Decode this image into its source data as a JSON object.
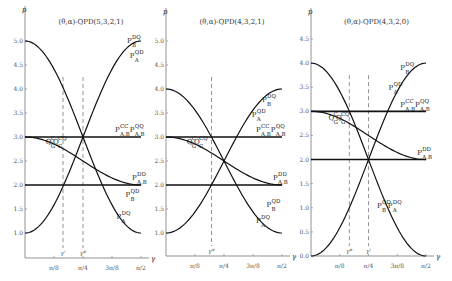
{
  "chart_data": [
    {
      "type": "line",
      "title": "(θ,α)-QPD(5,3,2,1)",
      "xlabel": "γ",
      "ylabel": "p",
      "xticks": [
        "π/8",
        "π/4",
        "3π/8",
        "π/2"
      ],
      "yticks": [
        "1.0",
        "1.5",
        "2.0",
        "2.5",
        "3.0",
        "3.5",
        "4.0",
        "4.5",
        "5.0"
      ],
      "xlim": [
        0,
        1.5708
      ],
      "ylim": [
        1.0,
        5.0
      ],
      "grid": false,
      "markers": [
        {
          "label": "γ'",
          "x": 0.5148,
          "style": "dashed"
        },
        {
          "label": "γ*",
          "x": 0.7854,
          "style": "dashed"
        }
      ],
      "series": [
        {
          "name": "P^DQ_B / P^QD_A (rising)",
          "formula": "3 - 2cos(2γ)",
          "x": [
            0,
            0.3927,
            0.7854,
            1.1781,
            1.5708
          ],
          "values": [
            1.0,
            1.59,
            3.0,
            4.41,
            5.0
          ]
        },
        {
          "name": "P^DQ_A / P^QD_B (falling)",
          "formula": "3 + 2cos(2γ)",
          "x": [
            0,
            0.3927,
            0.7854,
            1.1781,
            1.5708
          ],
          "values": [
            5.0,
            4.41,
            3.0,
            1.59,
            1.0
          ]
        },
        {
          "name": "P^CC_A,B  P^QQ_A,B",
          "x": [
            0,
            1.5708
          ],
          "values": [
            3.0,
            3.0
          ]
        },
        {
          "name": "P^DD_A,B",
          "x": [
            0,
            1.5708
          ],
          "values": [
            2.0,
            2.0
          ]
        },
        {
          "name": "Q_G curves",
          "formula": "2.5 + 0.5cos(2γ)",
          "x": [
            0,
            0.3927,
            0.7854,
            1.1781,
            1.5708
          ],
          "values": [
            3.0,
            2.85,
            2.5,
            2.15,
            2.0
          ]
        }
      ],
      "labels": [
        {
          "text": "P",
          "sup": "DQ",
          "sub": "B",
          "at": [
            1.38,
            4.95
          ]
        },
        {
          "text": "P",
          "sup": "QD",
          "sub": "A",
          "at": [
            1.42,
            4.65
          ]
        },
        {
          "text": "P",
          "sup": "CC",
          "sub": "A,B",
          "at": [
            1.22,
            3.1
          ]
        },
        {
          "text": "P",
          "sup": "QQ",
          "sub": "A,B",
          "at": [
            1.42,
            3.1
          ]
        },
        {
          "text": "P",
          "sup": "DD",
          "sub": "A,B",
          "at": [
            1.45,
            2.1
          ]
        },
        {
          "text": "P",
          "sup": "QD",
          "sub": "B",
          "at": [
            1.36,
            1.75
          ]
        },
        {
          "text": "P",
          "sup": "DQ",
          "sub": "A",
          "at": [
            1.24,
            1.3
          ]
        },
        {
          "text": "Q",
          "sup": "C",
          "sub": "G",
          "at": [
            0.28,
            2.86
          ],
          "rotate": -70
        },
        {
          "text": "Q",
          "sup": "CQ",
          "sub": "G",
          "at": [
            0.38,
            2.86
          ],
          "rotate": -70
        }
      ]
    },
    {
      "type": "line",
      "title": "(θ,α)-QPD(4,3,2,1)",
      "xlabel": "γ",
      "ylabel": "p",
      "xticks": [
        "π/8",
        "π/4",
        "3π/8",
        "π/2"
      ],
      "yticks": [
        "1.0",
        "1.5",
        "2.0",
        "2.5",
        "3.0",
        "3.5",
        "4.0",
        "4.5",
        "5.0"
      ],
      "xlim": [
        0,
        1.5708
      ],
      "ylim": [
        1.0,
        5.0
      ],
      "grid": false,
      "markers": [
        {
          "label": "γ*",
          "x": 0.6165,
          "style": "dashed"
        }
      ],
      "series": [
        {
          "name": "P^QD_A / P^DQ_B (rising)",
          "formula": "2.5 - 1.5cos(2γ)",
          "x": [
            0,
            0.3927,
            0.7854,
            1.1781,
            1.5708
          ],
          "values": [
            1.0,
            1.44,
            2.5,
            3.56,
            4.0
          ]
        },
        {
          "name": "P^DQ_A / P^QD_B (falling)",
          "formula": "2.5 + 1.5cos(2γ)",
          "x": [
            0,
            0.3927,
            0.7854,
            1.1781,
            1.5708
          ],
          "values": [
            4.0,
            3.56,
            2.5,
            1.44,
            1.0
          ]
        },
        {
          "name": "P^CC_A,B  P^QQ_A,B",
          "x": [
            0,
            1.5708
          ],
          "values": [
            3.0,
            3.0
          ]
        },
        {
          "name": "P^DD_A,B",
          "x": [
            0,
            1.5708
          ],
          "values": [
            2.0,
            2.0
          ]
        },
        {
          "name": "Q_G curves",
          "formula": "2.5 + 0.5cos(2γ)",
          "x": [
            0,
            0.3927,
            0.7854,
            1.1781,
            1.5708
          ],
          "values": [
            3.0,
            2.85,
            2.5,
            2.15,
            2.0
          ]
        }
      ],
      "labels": [
        {
          "text": "P",
          "sup": "QD",
          "sub": "A",
          "at": [
            1.16,
            3.42
          ]
        },
        {
          "text": "P",
          "sup": "DQ",
          "sub": "B",
          "at": [
            1.3,
            3.72
          ]
        },
        {
          "text": "P",
          "sup": "CC",
          "sub": "A,B",
          "at": [
            1.22,
            3.1
          ]
        },
        {
          "text": "P",
          "sup": "QQ",
          "sub": "A,B",
          "at": [
            1.42,
            3.1
          ]
        },
        {
          "text": "P",
          "sup": "DD",
          "sub": "A,B",
          "at": [
            1.45,
            2.1
          ]
        },
        {
          "text": "P",
          "sup": "QD",
          "sub": "B",
          "at": [
            1.36,
            1.55
          ]
        },
        {
          "text": "P",
          "sup": "DQ",
          "sub": "A",
          "at": [
            1.22,
            1.2
          ]
        },
        {
          "text": "Q",
          "sup": "C",
          "sub": "G",
          "at": [
            0.28,
            2.86
          ],
          "rotate": -70
        },
        {
          "text": "Q",
          "sup": "CQ",
          "sub": "G",
          "at": [
            0.38,
            2.86
          ],
          "rotate": -70
        }
      ]
    },
    {
      "type": "line",
      "title": "(θ,α)-QPD(4,3,2,0)",
      "xlabel": "γ",
      "ylabel": "p",
      "xticks": [
        "π/8",
        "π/4",
        "3π/8",
        "π/2"
      ],
      "yticks": [
        "0.0",
        "0.5",
        "1.0",
        "1.5",
        "2.0",
        "2.5",
        "3.0",
        "3.5",
        "4.0",
        "4.5"
      ],
      "xlim": [
        0,
        1.5708
      ],
      "ylim": [
        0.0,
        4.5
      ],
      "grid": false,
      "markers": [
        {
          "label": "γ*",
          "x": 0.5236,
          "style": "dashed"
        },
        {
          "label": "γ'",
          "x": 0.7854,
          "style": "dashed"
        }
      ],
      "series": [
        {
          "name": "P^QD_A / P^DQ_B (rising)",
          "formula": "2 - 2cos(2γ)",
          "x": [
            0,
            0.3927,
            0.7854,
            1.1781,
            1.5708
          ],
          "values": [
            0.0,
            0.59,
            2.0,
            3.41,
            4.0
          ]
        },
        {
          "name": "P^QD_B / P^DQ_A (falling)",
          "formula": "2 + 2cos(2γ)",
          "x": [
            0,
            0.3927,
            0.7854,
            1.1781,
            1.5708
          ],
          "values": [
            4.0,
            3.41,
            2.0,
            0.59,
            0.0
          ]
        },
        {
          "name": "P^CC_A,B  P^QQ_A,B",
          "x": [
            0,
            1.5708
          ],
          "values": [
            3.0,
            3.0
          ]
        },
        {
          "name": "P^DD_A,B",
          "x": [
            0,
            1.5708
          ],
          "values": [
            2.0,
            2.0
          ]
        },
        {
          "name": "Q_G curves",
          "formula": "2.5 + 0.5cos(2γ)",
          "x": [
            0,
            0.3927,
            0.7854,
            1.1781,
            1.5708
          ],
          "values": [
            3.0,
            2.85,
            2.5,
            2.15,
            2.0
          ]
        }
      ],
      "labels": [
        {
          "text": "P",
          "sup": "QD",
          "sub": "A",
          "at": [
            1.06,
            3.45
          ]
        },
        {
          "text": "P",
          "sup": "DQ",
          "sub": "B",
          "at": [
            1.22,
            3.85
          ]
        },
        {
          "text": "P",
          "sup": "CC",
          "sub": "A,B",
          "at": [
            1.22,
            3.1
          ]
        },
        {
          "text": "P",
          "sup": "QQ",
          "sub": "A,B",
          "at": [
            1.42,
            3.1
          ]
        },
        {
          "text": "P",
          "sup": "DD",
          "sub": "A,B",
          "at": [
            1.45,
            2.1
          ]
        },
        {
          "text": "P",
          "sup": "QD",
          "sub": "B",
          "at": [
            0.9,
            1.0
          ]
        },
        {
          "text": "P",
          "sup": "DQ",
          "sub": "A",
          "at": [
            1.05,
            1.0
          ]
        },
        {
          "text": "Q",
          "sup": "C",
          "sub": "G",
          "at": [
            0.24,
            2.82
          ],
          "rotate": -70
        },
        {
          "text": "Q",
          "sup": "CQ",
          "sub": "G",
          "at": [
            0.34,
            2.82
          ],
          "rotate": -70
        }
      ]
    }
  ],
  "panels_layout": [
    {
      "x0": 25,
      "x1": 141,
      "y0": 258,
      "ymin": 1.0,
      "ymaxPx": 41,
      "ymax": 5.0,
      "axisTop": 6,
      "axisBottom": 258
    },
    {
      "x0": 166,
      "x1": 282,
      "y0": 256,
      "ymin": 1.0,
      "ymaxPx": 41,
      "ymax": 5.0,
      "axisTop": 8,
      "axisBottom": 256
    },
    {
      "x0": 311,
      "x1": 426,
      "y0": 256,
      "ymin": 0.0,
      "ymaxPx": 39,
      "ymax": 4.5,
      "axisTop": 8,
      "axisBottom": 256
    }
  ]
}
